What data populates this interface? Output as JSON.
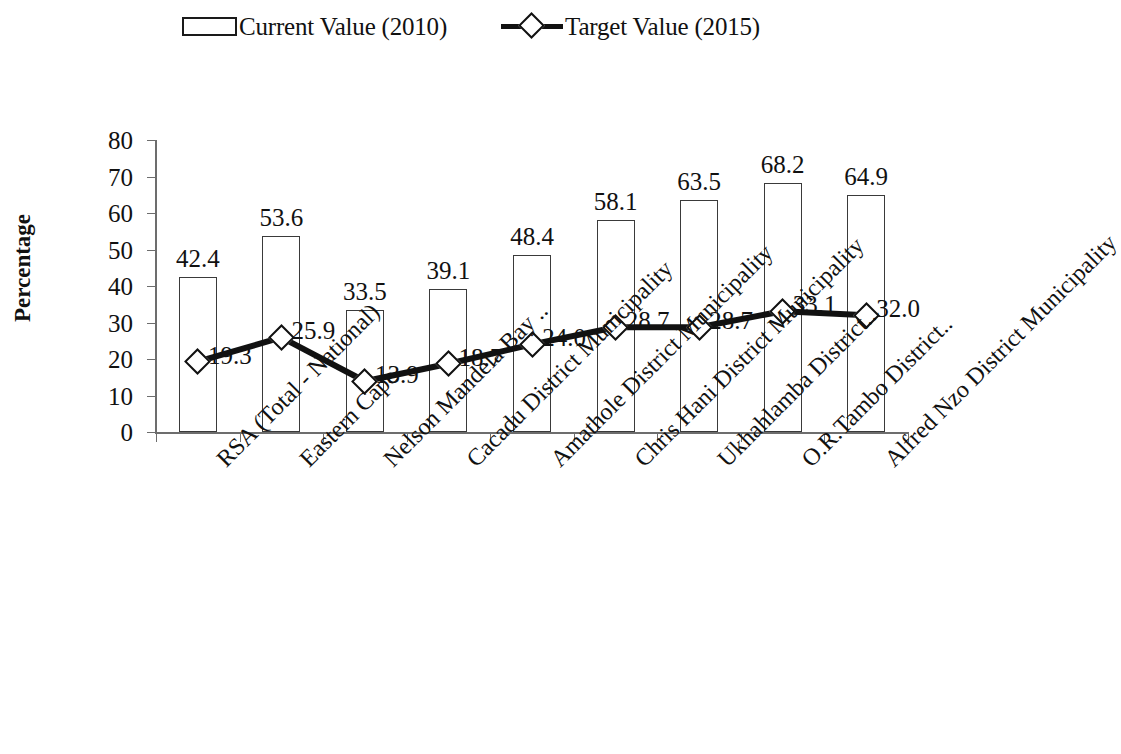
{
  "chart_data": {
    "type": "bar",
    "title": "",
    "xlabel": "",
    "ylabel": "Percentage",
    "ylim": [
      0,
      80
    ],
    "ytick_values": [
      0,
      10,
      20,
      30,
      40,
      50,
      60,
      70,
      80
    ],
    "ytick_labels": [
      "0",
      "10",
      "20",
      "30",
      "40",
      "50",
      "60",
      "70",
      "80"
    ],
    "grid": false,
    "legend_position": "top-center",
    "categories": [
      "RSA (Total - National)",
      "Eastern Cape",
      "Nelson Mandela Bay ..",
      "Cacadu District Municipality",
      "Amathole District Municipality",
      "Chris Hani District Municipality",
      "Ukhahlamba District..",
      "O.R.Tambo District..",
      "Alfred Nzo District Municipality"
    ],
    "series": [
      {
        "name": "Current Value (2010)",
        "type": "bar",
        "values": [
          42.4,
          53.6,
          33.5,
          39.1,
          48.4,
          58.1,
          63.5,
          68.2,
          64.9
        ],
        "labels": [
          "42.4",
          "53.6",
          "33.5",
          "39.1",
          "48.4",
          "58.1",
          "63.5",
          "68.2",
          "64.9"
        ]
      },
      {
        "name": "Target Value (2015)",
        "type": "line",
        "values": [
          19.3,
          25.9,
          13.9,
          18.7,
          24.0,
          28.7,
          28.7,
          33.1,
          32.0
        ],
        "labels": [
          "19.3",
          "25.9",
          "13.9",
          "18.7",
          "24.0",
          "28.7",
          "28.7",
          "33.1",
          "32.0"
        ]
      }
    ],
    "colors": {
      "bar_fill": "#ffffff",
      "bar_stroke": "#3a3a3a",
      "line": "#111111",
      "marker_fill": "#ffffff",
      "marker_stroke": "#111111",
      "axis": "#6d6d6d",
      "text": "#111111",
      "background": "#ffffff"
    }
  },
  "legend": {
    "entries": [
      {
        "label": "Current Value (2010)",
        "marker": "bar-swatch-icon"
      },
      {
        "label": "Target Value (2015)",
        "marker": "line-diamond-icon"
      }
    ]
  }
}
